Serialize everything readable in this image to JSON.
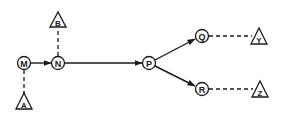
{
  "diagram": {
    "type": "directed-graph",
    "colors": {
      "stroke": "#1a1a1a",
      "background": "#ffffff"
    },
    "circle_nodes": [
      {
        "id": "M",
        "label": "M",
        "cx": 24,
        "cy": 63
      },
      {
        "id": "N",
        "label": "N",
        "cx": 58,
        "cy": 63
      },
      {
        "id": "P",
        "label": "P",
        "cx": 149,
        "cy": 63
      },
      {
        "id": "Q",
        "label": "Q",
        "cx": 202,
        "cy": 36
      },
      {
        "id": "R",
        "label": "R",
        "cx": 202,
        "cy": 89
      }
    ],
    "triangle_nodes": [
      {
        "id": "A",
        "label": "A",
        "cx": 24,
        "top": 93,
        "bottom": 109
      },
      {
        "id": "B",
        "label": "B",
        "cx": 58,
        "top": 12,
        "bottom": 27
      },
      {
        "id": "Y",
        "label": "Y",
        "cx": 259,
        "top": 28,
        "bottom": 44
      },
      {
        "id": "Z",
        "label": "Z",
        "cx": 260,
        "top": 81,
        "bottom": 97
      }
    ],
    "solid_arrows": [
      {
        "from": "M",
        "to": "N"
      },
      {
        "from": "N",
        "to": "P"
      },
      {
        "from": "P",
        "to": "Q"
      },
      {
        "from": "P",
        "to": "R"
      }
    ],
    "dashed_links": [
      {
        "from": "M",
        "to": "A"
      },
      {
        "from": "N",
        "to": "B"
      },
      {
        "from": "Q",
        "to": "Y"
      },
      {
        "from": "R",
        "to": "Z"
      }
    ]
  }
}
